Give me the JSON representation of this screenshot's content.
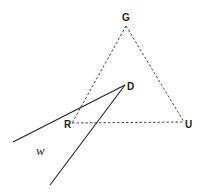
{
  "diagram": {
    "points": {
      "G": {
        "label": "G",
        "x": 126,
        "y": 26
      },
      "R": {
        "label": "R",
        "x": 72,
        "y": 123
      },
      "U": {
        "label": "U",
        "x": 184,
        "y": 122
      },
      "D": {
        "label": "D",
        "x": 125,
        "y": 85
      }
    },
    "triangle": {
      "vertices": [
        "G",
        "R",
        "U"
      ],
      "style": "dashed"
    },
    "solid_lines": [
      {
        "from": "D",
        "to": [
          13,
          142
        ]
      },
      {
        "from": "D",
        "to": [
          50,
          185
        ]
      }
    ],
    "region_label": "w",
    "line_color": "#222222"
  }
}
